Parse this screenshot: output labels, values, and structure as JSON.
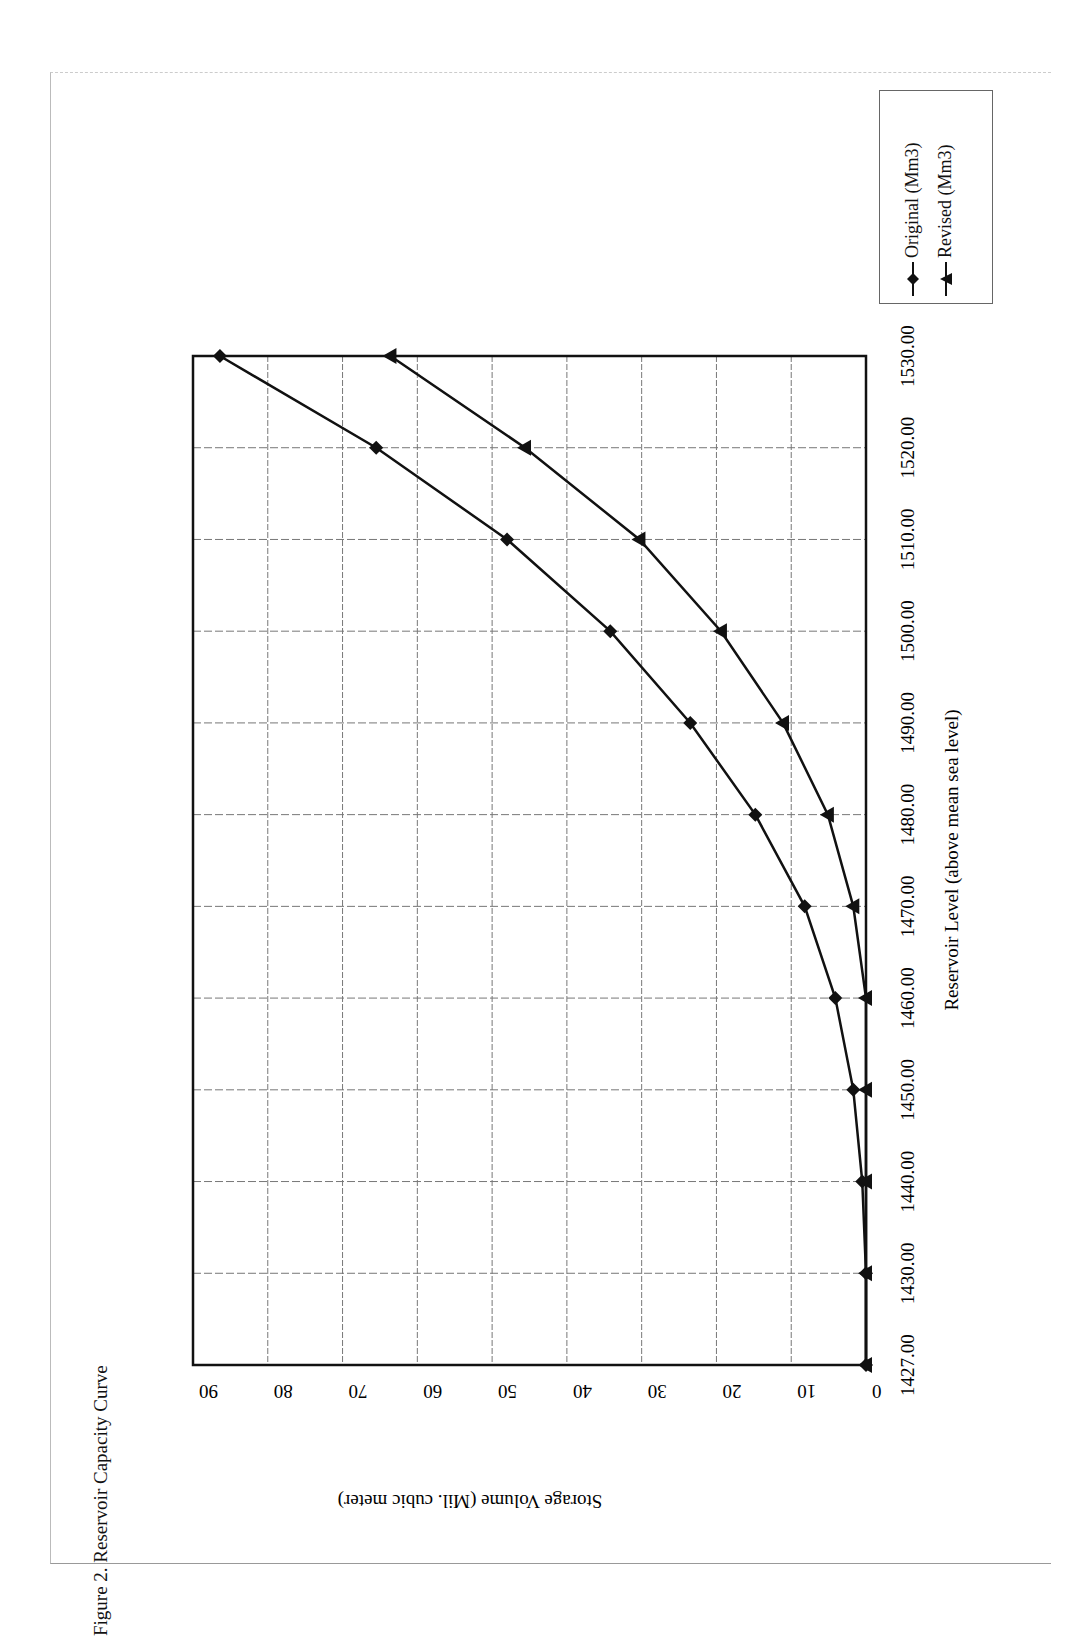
{
  "figure": {
    "caption": "Figure 2.  Reservoir Capacity Curve"
  },
  "legend": {
    "items": [
      {
        "label": "Original (Mm3)",
        "marker": "diamond"
      },
      {
        "label": "Revised (Mm3)",
        "marker": "triangle"
      }
    ]
  },
  "axes": {
    "x_label": "Reservoir Level (above mean sea level)",
    "y_label": "Storage Volume (Mil. cubic meter)"
  },
  "chart_data": {
    "type": "line",
    "title": "Reservoir Capacity Curve",
    "orientation": "rotated 90° counter-clockwise on page",
    "xlabel": "Reservoir Level (above mean sea level)",
    "ylabel": "Storage Volume (Mil. cubic meter)",
    "categories": [
      "1427.00",
      "1430.00",
      "1440.00",
      "1450.00",
      "1460.00",
      "1470.00",
      "1480.00",
      "1490.00",
      "1500.00",
      "1510.00",
      "1520.00",
      "1530.00"
    ],
    "x": [
      1427,
      1430,
      1440,
      1450,
      1460,
      1470,
      1480,
      1490,
      1500,
      1510,
      1520,
      1530
    ],
    "series": [
      {
        "name": "Original (Mm3)",
        "marker": "diamond",
        "values": [
          0,
          0,
          0.5,
          1.7,
          4.1,
          8.2,
          14.8,
          23.5,
          34.2,
          48.0,
          65.5,
          86.4
        ]
      },
      {
        "name": "Revised (Mm3)",
        "marker": "triangle",
        "values": [
          0,
          0,
          0,
          0,
          0,
          1.7,
          5.1,
          11.1,
          19.4,
          30.3,
          45.6,
          63.6
        ]
      }
    ],
    "y_ticks": [
      "0",
      "10",
      "20",
      "30",
      "40",
      "50",
      "60",
      "70",
      "80",
      "90"
    ],
    "ylim": [
      0,
      90
    ],
    "xlim": [
      1427,
      1530
    ],
    "grid": true,
    "legend_position": "right"
  }
}
